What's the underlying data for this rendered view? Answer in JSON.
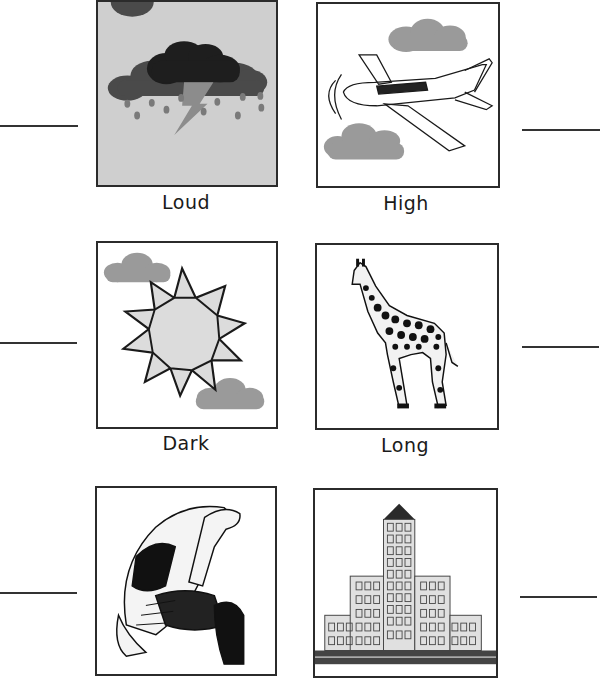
{
  "worksheet": {
    "cards": [
      {
        "id": "storm",
        "picture": "thundercloud-with-rain-and-lightning",
        "label": "Loud"
      },
      {
        "id": "airplane",
        "picture": "airplane-between-clouds",
        "label": "High"
      },
      {
        "id": "sun",
        "picture": "sun-with-clouds",
        "label": "Dark"
      },
      {
        "id": "giraffe",
        "picture": "giraffe",
        "label": "Long"
      },
      {
        "id": "tortoise",
        "picture": "tortoise",
        "label": ""
      },
      {
        "id": "building",
        "picture": "tall-building",
        "label": ""
      }
    ],
    "answer_lines": [
      {
        "side": "left",
        "row": 1
      },
      {
        "side": "right",
        "row": 1
      },
      {
        "side": "left",
        "row": 2
      },
      {
        "side": "right",
        "row": 2
      },
      {
        "side": "left",
        "row": 3
      },
      {
        "side": "right",
        "row": 3
      }
    ],
    "colors": {
      "frame": "#2b2b2b",
      "storm_bg": "#cfcfcf",
      "cloud_gray": "#9a9a9a",
      "dark_cloud": "#1e1e1e",
      "sun_fill": "#dcdcdc"
    }
  }
}
